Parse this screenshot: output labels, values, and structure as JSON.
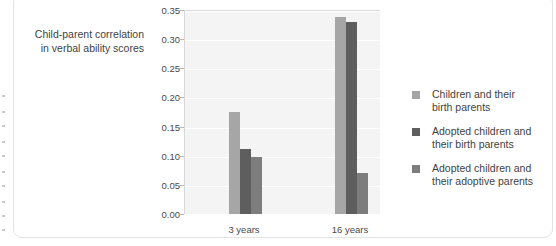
{
  "axis_caption": {
    "line1": "Child-parent correlation",
    "line2": "in verbal ability scores"
  },
  "legend": {
    "items": [
      {
        "label_line1": "Children and their",
        "label_line2": "birth parents",
        "color": "#a6a6a6"
      },
      {
        "label_line1": "Adopted children and",
        "label_line2": "their birth parents",
        "color": "#5e5e5e"
      },
      {
        "label_line1": "Adopted children and",
        "label_line2": "their adoptive parents",
        "color": "#7d7d7d"
      }
    ]
  },
  "chart_data": {
    "type": "bar",
    "title": "",
    "xlabel": "",
    "ylabel": "Child-parent correlation in verbal ability scores",
    "categories": [
      "3 years",
      "16 years"
    ],
    "ylim": [
      0.0,
      0.35
    ],
    "ytick_step": 0.05,
    "ytick_labels": [
      "0.00",
      "0.05",
      "0.10",
      "0.15",
      "0.20",
      "0.25",
      "0.30",
      "0.35"
    ],
    "grid": true,
    "legend_position": "right",
    "series": [
      {
        "name": "Children and their birth parents",
        "color": "#a6a6a6",
        "values": [
          0.175,
          0.338
        ]
      },
      {
        "name": "Adopted children and their birth parents",
        "color": "#5e5e5e",
        "values": [
          0.112,
          0.329
        ]
      },
      {
        "name": "Adopted children and their adoptive parents",
        "color": "#7d7d7d",
        "values": [
          0.097,
          0.07
        ]
      }
    ]
  }
}
